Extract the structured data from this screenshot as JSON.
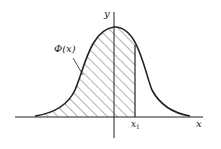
{
  "diagram": {
    "title": "",
    "x_axis_label": "x",
    "y_axis_label": "y",
    "curve_label": "Φ(x)",
    "marker_label": "x",
    "marker_subscript": "1",
    "colors": {
      "stroke": "#222222",
      "hatch": "#444444",
      "background": "#ffffff"
    }
  }
}
